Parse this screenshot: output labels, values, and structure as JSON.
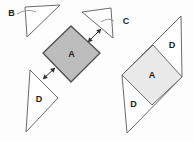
{
  "diagram": {
    "canvas": {
      "width": 193,
      "height": 141,
      "background": "#fdfdfd"
    },
    "colors": {
      "background": "#fdfdfd",
      "outline": "#6b6b6b",
      "square_outline": "#4f4f4f",
      "square_a_fill": "#bdbdbd",
      "diamond_a_fill": "#e9e9e9",
      "white_fill": "#fefefe",
      "label": "#1c1c1c",
      "arrow": "#2e2e2e",
      "leader": "#8f8f8f"
    },
    "shapes": [
      {
        "id": "triangle-b",
        "type": "polygon",
        "points": [
          [
            25,
            7
          ],
          [
            60,
            5
          ],
          [
            27,
            37
          ]
        ],
        "fill": "white_fill",
        "stroke": "outline",
        "stroke_width": 1
      },
      {
        "id": "triangle-c",
        "type": "polygon",
        "points": [
          [
            82,
            12
          ],
          [
            111,
            8
          ],
          [
            113,
            38
          ]
        ],
        "fill": "white_fill",
        "stroke": "outline",
        "stroke_width": 1
      },
      {
        "id": "square-a-left",
        "type": "polygon",
        "points": [
          [
            71,
            26
          ],
          [
            100,
            53
          ],
          [
            71,
            82
          ],
          [
            43,
            53
          ]
        ],
        "fill": "square_a_fill",
        "stroke": "square_outline",
        "stroke_width": 1.3
      },
      {
        "id": "triangle-d-left",
        "type": "polygon",
        "points": [
          [
            30,
            70
          ],
          [
            58,
            98
          ],
          [
            26,
            132
          ]
        ],
        "fill": "white_fill",
        "stroke": "outline",
        "stroke_width": 1
      },
      {
        "id": "parallelogram-right",
        "type": "polygon",
        "points": [
          [
            181,
            16
          ],
          [
            182,
            77
          ],
          [
            127,
            133
          ],
          [
            122,
            75
          ]
        ],
        "fill": "white_fill",
        "stroke": "outline",
        "stroke_width": 1
      },
      {
        "id": "diamond-a-right",
        "type": "polygon",
        "points": [
          [
            153,
            45
          ],
          [
            182,
            77
          ],
          [
            152,
            105
          ],
          [
            122,
            75
          ]
        ],
        "fill": "diamond_a_fill",
        "stroke": "outline",
        "stroke_width": 1
      }
    ],
    "leaders": [
      {
        "id": "label-b-leader-line",
        "path": "M 17 14 Q 27 8 36 12"
      },
      {
        "id": "label-c-leader-line",
        "path": "M 101 22 Q 108 17 114 21"
      }
    ],
    "arrows": [
      {
        "id": "move-arrow-top-right",
        "x1": 88,
        "y1": 42,
        "x2": 101,
        "y2": 29
      },
      {
        "id": "move-arrow-bottom-left",
        "x1": 43,
        "y1": 79,
        "x2": 55,
        "y2": 68
      }
    ],
    "labels": [
      {
        "id": "label-b",
        "text": "B",
        "x": 11.5,
        "y": 16
      },
      {
        "id": "label-c",
        "text": "C",
        "x": 126,
        "y": 24
      },
      {
        "id": "label-a-left-square",
        "text": "A",
        "x": 71.5,
        "y": 57
      },
      {
        "id": "label-d-left-triangle",
        "text": "D",
        "x": 39,
        "y": 102
      },
      {
        "id": "label-d-top-right",
        "text": "D",
        "x": 172,
        "y": 48
      },
      {
        "id": "label-a-right-diamond",
        "text": "A",
        "x": 152,
        "y": 78
      },
      {
        "id": "label-d-bottom-right",
        "text": "D",
        "x": 133.5,
        "y": 107
      }
    ]
  }
}
